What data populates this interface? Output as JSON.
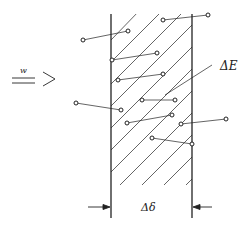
{
  "diagram": {
    "labels": {
      "flow": "w",
      "energy": "ΔE",
      "thickness": "Δδ"
    },
    "colors": {
      "stroke": "#222222",
      "background": "#ffffff"
    },
    "walls": {
      "left_x": 111,
      "right_x": 192,
      "top_y": 14,
      "bottom_y": 218
    },
    "particles": [
      {
        "from": [
          83,
          40
        ],
        "to": [
          128,
          31
        ]
      },
      {
        "from": [
          163,
          20
        ],
        "to": [
          208,
          15
        ]
      },
      {
        "from": [
          112,
          60
        ],
        "to": [
          157,
          53
        ]
      },
      {
        "from": [
          118,
          80
        ],
        "to": [
          163,
          74
        ]
      },
      {
        "from": [
          76,
          103
        ],
        "to": [
          121,
          110
        ]
      },
      {
        "from": [
          142,
          100
        ],
        "to": [
          175,
          100
        ]
      },
      {
        "from": [
          127,
          123
        ],
        "to": [
          172,
          115
        ]
      },
      {
        "from": [
          181,
          124
        ],
        "to": [
          226,
          119
        ]
      },
      {
        "from": [
          152,
          138
        ],
        "to": [
          192,
          144
        ]
      }
    ]
  }
}
